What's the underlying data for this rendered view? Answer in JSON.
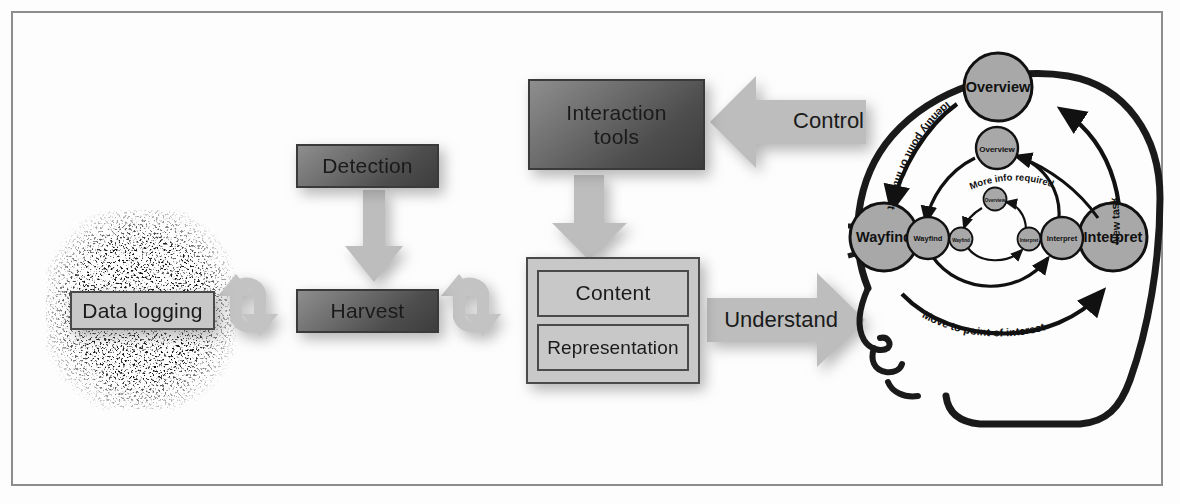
{
  "figure": {
    "frame_color": "#8d8d8d",
    "background": "#fdfdfd"
  },
  "pipeline": {
    "data_source": {
      "label": "Data logging",
      "style": "light-box"
    },
    "detection": {
      "label": "Detection",
      "style": "dark-box"
    },
    "harvest": {
      "label": "Harvest",
      "style": "dark-box"
    },
    "interaction_tools": {
      "label": "Interaction\ntools",
      "line1": "Interaction",
      "line2": "tools",
      "style": "dark-box"
    },
    "content": {
      "label": "Content",
      "style": "light-box"
    },
    "representation": {
      "label": "Representation",
      "style": "light-box"
    }
  },
  "arrows": {
    "cycle_1": {
      "icon": "cycle-arrows-icon",
      "label": ""
    },
    "cycle_2": {
      "icon": "cycle-arrows-icon",
      "label": ""
    },
    "detection_to_harvest": {
      "icon": "down-arrow-icon",
      "label": ""
    },
    "tools_to_content": {
      "icon": "down-arrow-icon",
      "label": ""
    },
    "control": {
      "label": "Control",
      "direction": "left",
      "icon": "left-arrow-icon"
    },
    "understand": {
      "label": "Understand",
      "direction": "right",
      "icon": "right-arrow-icon"
    }
  },
  "sensemaking_loop": {
    "head_outline": "human-head-profile",
    "outer_cycle": {
      "nodes": [
        {
          "id": "overview",
          "label": "Overview"
        },
        {
          "id": "wayfind",
          "label": "Wayfind"
        },
        {
          "id": "interpret",
          "label": "Interpret"
        }
      ],
      "edges": [
        {
          "from": "overview",
          "to": "wayfind",
          "label": "Identify point of interest"
        },
        {
          "from": "wayfind",
          "to": "interpret",
          "label": "Move to point of interest"
        },
        {
          "from": "interpret",
          "to": "overview",
          "label": "New task"
        }
      ]
    },
    "middle_cycle": {
      "nodes": [
        {
          "id": "overview",
          "label": "Overview"
        },
        {
          "id": "wayfind",
          "label": "Wayfind"
        },
        {
          "id": "interpret",
          "label": "Interpret"
        }
      ],
      "edges": [
        {
          "from": "interpret",
          "to": "overview",
          "label": "More info required"
        }
      ]
    },
    "inner_cycle": {
      "nodes": [
        {
          "id": "overview",
          "label": "Overview"
        },
        {
          "id": "wayfind",
          "label": "Wayfind"
        },
        {
          "id": "interpret",
          "label": "Interpret"
        }
      ],
      "edges": []
    }
  },
  "colors": {
    "light_box_fill": "#c8c8c8",
    "dark_box_dark": "#3d3d3d",
    "dark_box_light": "#8e8e8e",
    "flow_arrow": "#bdbdbd",
    "node_circle_fill": "#a8a8a8",
    "stroke": "#1a1a1a"
  }
}
